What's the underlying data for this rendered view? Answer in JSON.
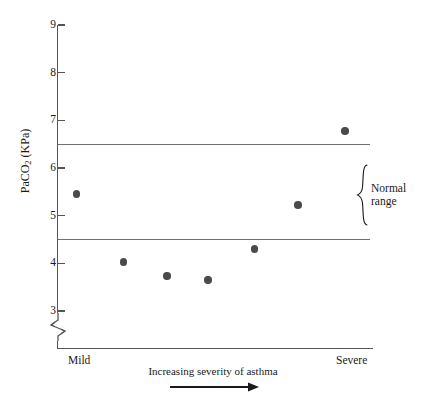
{
  "chart_data": {
    "type": "scatter",
    "title": "",
    "xlabel": "Increasing severity of asthma",
    "ylabel": "PaCO₂ (KPa)",
    "ylabel_main": "PaCO",
    "ylabel_sub": "2",
    "ylabel_units": " (KPa)",
    "ylim": [
      3,
      9
    ],
    "y_axis_break": true,
    "grid": false,
    "legend": "none",
    "y_ticks": [
      {
        "value": 9,
        "label": "9"
      },
      {
        "value": 8,
        "label": "8"
      },
      {
        "value": 7,
        "label": "7"
      },
      {
        "value": 6,
        "label": "6"
      },
      {
        "value": 5,
        "label": "5"
      },
      {
        "value": 4,
        "label": "4"
      },
      {
        "value": 3,
        "label": "3"
      }
    ],
    "x_categories": [
      "Mild",
      "Severe"
    ],
    "x_tick_labels": {
      "left": "Mild",
      "right": "Severe"
    },
    "points": [
      {
        "x": 0.06,
        "y": 5.45
      },
      {
        "x": 0.21,
        "y": 4.03
      },
      {
        "x": 0.35,
        "y": 3.73
      },
      {
        "x": 0.48,
        "y": 3.65
      },
      {
        "x": 0.63,
        "y": 4.3
      },
      {
        "x": 0.77,
        "y": 5.22
      },
      {
        "x": 0.92,
        "y": 6.78
      }
    ],
    "reference_bands": [
      {
        "name": "Normal range",
        "upper": 6.5,
        "lower": 4.5,
        "label": "Normal\nrange",
        "label_line_1": "Normal",
        "label_line_2": "range"
      }
    ],
    "annotations": [
      {
        "name": "x-axis-direction-arrow",
        "text": "",
        "icon": "right-arrow-icon"
      }
    ],
    "colors": {
      "point": "#4a4a4a",
      "axis": "#555555",
      "reference_line": "#707070",
      "text": "#1a1a1a",
      "background": "#ffffff"
    }
  }
}
